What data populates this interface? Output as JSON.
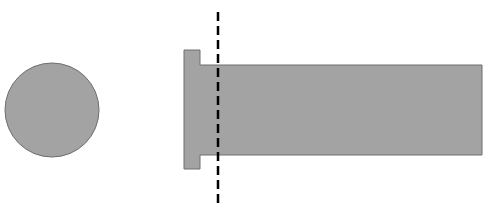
{
  "diagram": {
    "colors": {
      "fill": "#a3a3a3",
      "stroke": "#6e6e6e",
      "cut_line": "#000000",
      "background": "#ffffff"
    },
    "circle": {
      "cx": 52,
      "cy": 110,
      "r": 47
    },
    "flange": {
      "x": 184,
      "y": 50,
      "w": 16,
      "h": 119
    },
    "shaft": {
      "x": 200,
      "y": 65,
      "w": 282,
      "h": 90
    },
    "cut_line": {
      "x": 218,
      "y1": 12,
      "y2": 208,
      "dash": "9,5"
    }
  }
}
